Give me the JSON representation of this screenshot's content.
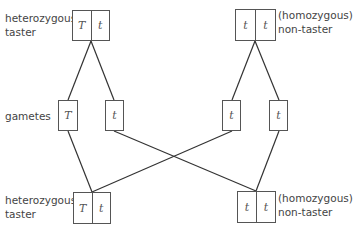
{
  "parents": {
    "left": {
      "label_line1": "heterozygous",
      "label_line2": "taster",
      "alleles": [
        "T",
        "t"
      ]
    },
    "right": {
      "label_line1": "(homozygous)",
      "label_line2": "non-taster",
      "alleles": [
        "t",
        "t"
      ]
    }
  },
  "gametes": {
    "label": "gametes",
    "items": [
      "T",
      "t",
      "t",
      "t"
    ]
  },
  "offspring": {
    "left": {
      "label_line1": "heterozygous",
      "label_line2": "taster",
      "alleles": [
        "T",
        "t"
      ]
    },
    "right": {
      "label_line1": "(homozygous)",
      "label_line2": "non-taster",
      "alleles": [
        "t",
        "t"
      ]
    }
  }
}
